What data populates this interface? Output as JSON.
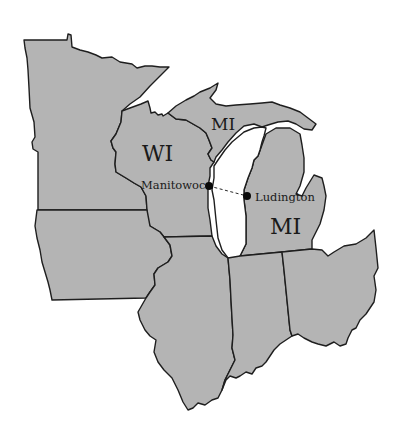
{
  "map": {
    "fill_color": "#b4b4b4",
    "border_color": "#1e1e1e",
    "background_color": "#ffffff",
    "states": [
      {
        "id": "MN",
        "label": ""
      },
      {
        "id": "WI",
        "label": "WI"
      },
      {
        "id": "MI-upper",
        "label": "MI"
      },
      {
        "id": "MI-lower",
        "label": "MI"
      },
      {
        "id": "IA",
        "label": ""
      },
      {
        "id": "IL",
        "label": ""
      },
      {
        "id": "IN",
        "label": ""
      },
      {
        "id": "OH",
        "label": ""
      }
    ],
    "water": [
      {
        "id": "lake-michigan",
        "label": ""
      }
    ],
    "cities": [
      {
        "name": "Manitowoc",
        "x": 209,
        "y": 186
      },
      {
        "name": "Ludington",
        "x": 247,
        "y": 196
      }
    ],
    "route": {
      "from": "Manitowoc",
      "to": "Ludington",
      "style": "dashed"
    }
  }
}
